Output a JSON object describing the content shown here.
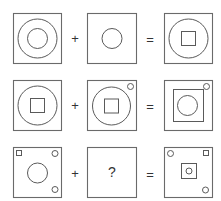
{
  "puzzle": {
    "rows": [
      {
        "operator_plus": "+",
        "operator_equals": "=",
        "cells": [
          {
            "position": "left",
            "shapes": [
              "outer-circle",
              "inner-circle"
            ]
          },
          {
            "position": "middle",
            "shapes": [
              "circle"
            ]
          },
          {
            "position": "right",
            "shapes": [
              "circle",
              "square"
            ]
          }
        ]
      },
      {
        "operator_plus": "+",
        "operator_equals": "=",
        "cells": [
          {
            "position": "left",
            "shapes": [
              "circle",
              "square"
            ]
          },
          {
            "position": "middle",
            "shapes": [
              "circle",
              "square",
              "small-circle-top-right"
            ]
          },
          {
            "position": "right",
            "shapes": [
              "square",
              "circle",
              "small-circle-top-right"
            ]
          }
        ]
      },
      {
        "operator_plus": "+",
        "operator_equals": "=",
        "cells": [
          {
            "position": "left",
            "shapes": [
              "small-square-top-left",
              "small-circle-top-right",
              "circle",
              "small-circle-bottom-right"
            ]
          },
          {
            "position": "middle",
            "label": "?"
          },
          {
            "position": "right",
            "shapes": [
              "small-circle-top-left",
              "small-square-top-right",
              "square",
              "small-circle",
              "small-circle-bottom-right"
            ]
          }
        ]
      }
    ]
  },
  "colors": {
    "stroke": "#5a5a5a",
    "background": "#ffffff"
  }
}
